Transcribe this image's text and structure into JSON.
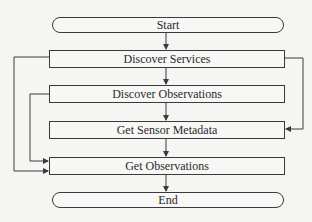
{
  "flowchart": {
    "nodes": [
      {
        "id": "start",
        "label": "Start",
        "shape": "terminator"
      },
      {
        "id": "discover-services",
        "label": "Discover Services",
        "shape": "process"
      },
      {
        "id": "discover-observations",
        "label": "Discover Observations",
        "shape": "process"
      },
      {
        "id": "get-sensor-metadata",
        "label": "Get Sensor Metadata",
        "shape": "process"
      },
      {
        "id": "get-observations",
        "label": "Get Observations",
        "shape": "process"
      },
      {
        "id": "end",
        "label": "End",
        "shape": "terminator"
      }
    ],
    "edges": [
      {
        "from": "start",
        "to": "discover-services"
      },
      {
        "from": "discover-services",
        "to": "discover-observations"
      },
      {
        "from": "discover-observations",
        "to": "get-sensor-metadata"
      },
      {
        "from": "get-sensor-metadata",
        "to": "get-observations"
      },
      {
        "from": "get-observations",
        "to": "end"
      },
      {
        "from": "discover-services",
        "to": "get-sensor-metadata",
        "route": "right-bypass"
      },
      {
        "from": "discover-services",
        "to": "get-observations",
        "route": "left-outer-bypass"
      },
      {
        "from": "discover-observations",
        "to": "get-observations",
        "route": "left-inner-bypass"
      }
    ]
  },
  "colors": {
    "line": "#3a3a3a",
    "background": "#f5f5f3"
  }
}
